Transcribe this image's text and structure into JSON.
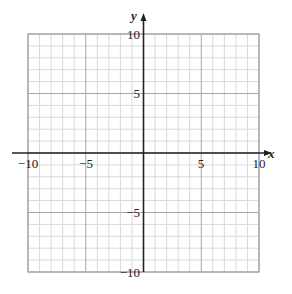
{
  "chart_data": {
    "type": "scatter",
    "title": "",
    "xlabel": "x",
    "ylabel": "y",
    "xlim": [
      -10,
      10
    ],
    "ylim": [
      -10,
      10
    ],
    "grid": true,
    "minor_grid_step": 1,
    "major_grid_step": 5,
    "x_tick_labels": [
      "-10",
      "-5",
      "5",
      "10"
    ],
    "y_tick_labels": [
      "10",
      "5",
      "-5",
      "-10"
    ],
    "series": []
  },
  "labels": {
    "x_axis": "x",
    "y_axis": "y",
    "x_ticks": [
      "−10",
      "−5",
      "5",
      "10"
    ],
    "y_ticks": [
      "10",
      "5",
      "−5",
      "−10"
    ]
  },
  "colors": {
    "minor_grid": "#d9d9d9",
    "major_grid": "#a6a6a6",
    "border": "#a6a6a6",
    "axis": "#222222"
  }
}
